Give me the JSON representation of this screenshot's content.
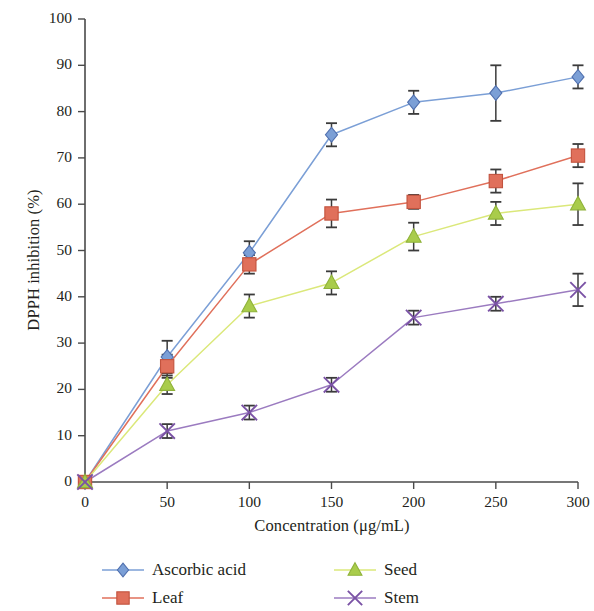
{
  "chart_data": {
    "type": "line",
    "title": "",
    "subtitle": "",
    "xlabel": "Concentration (μg/mL)",
    "ylabel": "DPPH inhibition (%)",
    "xlim": [
      0,
      300
    ],
    "ylim": [
      0,
      100
    ],
    "xticks": [
      0,
      50,
      100,
      150,
      200,
      250,
      300
    ],
    "yticks": [
      0,
      10,
      20,
      30,
      40,
      50,
      60,
      70,
      80,
      90,
      100
    ],
    "xtick_labels": [
      "0",
      "50",
      "100",
      "150",
      "200",
      "250",
      "300"
    ],
    "ytick_labels": [
      "0",
      "10",
      "20",
      "30",
      "40",
      "50",
      "60",
      "70",
      "80",
      "90",
      "100"
    ],
    "grid": false,
    "legend_position": "bottom",
    "x": [
      0,
      50,
      100,
      150,
      200,
      250,
      300
    ],
    "series": [
      {
        "name": "Ascorbic acid",
        "marker": "diamond",
        "color": "#7b9fd6",
        "marker_fill": "#7b9fd6",
        "marker_edge": "#4f6fae",
        "values": [
          0,
          27,
          49.5,
          75,
          82,
          84,
          87.5
        ],
        "errors": [
          0,
          3.5,
          2.5,
          2.5,
          2.5,
          6,
          2.5
        ]
      },
      {
        "name": "Leaf",
        "marker": "square",
        "color": "#e0705b",
        "marker_fill": "#e0705b",
        "marker_edge": "#c2533e",
        "values": [
          0,
          25,
          47,
          58,
          60.5,
          65,
          70.5
        ],
        "errors": [
          0,
          2.5,
          2,
          3,
          1.5,
          2.5,
          2.5
        ]
      },
      {
        "name": "Seed",
        "marker": "triangle",
        "color": "#dbe87a",
        "marker_fill": "#a9cc4b",
        "marker_edge": "#8fb23a",
        "values": [
          0,
          21,
          38,
          43,
          53,
          58,
          60
        ],
        "errors": [
          0,
          2,
          2.5,
          2.5,
          3,
          2.5,
          4.5
        ]
      },
      {
        "name": "Stem",
        "marker": "x",
        "color": "#9b7bc0",
        "marker_fill": "#8a62b5",
        "marker_edge": "#7a52a5",
        "values": [
          0,
          11,
          15,
          21,
          35.5,
          38.5,
          41.5
        ],
        "errors": [
          0,
          1.5,
          1.5,
          1.5,
          1.5,
          1.5,
          3.5
        ]
      }
    ]
  },
  "legend": {
    "items": [
      {
        "label": "Ascorbic acid",
        "series_index": 0
      },
      {
        "label": "Seed",
        "series_index": 2
      },
      {
        "label": "Leaf",
        "series_index": 1
      },
      {
        "label": "Stem",
        "series_index": 3
      }
    ]
  },
  "axes": {
    "x_label": "Concentration (μg/mL)",
    "y_label": "DPPH inhibition (%)"
  }
}
